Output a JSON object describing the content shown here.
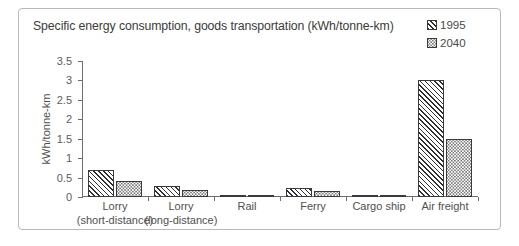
{
  "chart_data": {
    "type": "bar",
    "title": "Specific energy consumption, goods transportation (kWh/tonne-km)",
    "xlabel": "",
    "ylabel": "kWh/tonne-km",
    "ylim": [
      0,
      3.5
    ],
    "yticks": [
      "0",
      "0.5",
      "1",
      "1.5",
      "2",
      "2.5",
      "3",
      "3.5"
    ],
    "ytick_values": [
      0,
      0.5,
      1,
      1.5,
      2,
      2.5,
      3,
      3.5
    ],
    "grid": false,
    "legend_position": "top-right",
    "categories": [
      "Lorry\n(short-distance)",
      "Lorry\n(long-distance)",
      "Rail",
      "Ferry",
      "Cargo ship",
      "Air freight"
    ],
    "category_lines": [
      [
        "Lorry",
        "(short-distance)"
      ],
      [
        "Lorry",
        "(long-distance)"
      ],
      [
        "Rail",
        ""
      ],
      [
        "Ferry",
        ""
      ],
      [
        "Cargo ship",
        ""
      ],
      [
        "Air freight",
        ""
      ]
    ],
    "series": [
      {
        "name": "1995",
        "pattern": "diagonal-hatch",
        "values": [
          0.7,
          0.28,
          0.05,
          0.22,
          0.06,
          3.0
        ]
      },
      {
        "name": "2040",
        "pattern": "dotted",
        "values": [
          0.42,
          0.18,
          0.03,
          0.15,
          0.02,
          1.5
        ]
      }
    ]
  },
  "legend": {
    "items": [
      {
        "label": "1995",
        "swatch": "hatch-swatch"
      },
      {
        "label": "2040",
        "swatch": "dots-swatch"
      }
    ]
  },
  "colors": {
    "border": "#b9b9b9",
    "axis": "#6e6e6e",
    "bar_outline": "#3a3a3a",
    "title_text": "#3b3b3b",
    "label_text": "#4f4f4f",
    "background": "#ffffff"
  }
}
